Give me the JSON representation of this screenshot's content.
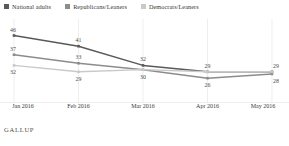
{
  "chart_data": {
    "type": "line",
    "title": "",
    "subtitle": "",
    "xlabel": "",
    "ylabel": "",
    "categories": [
      "Jan 2016",
      "Feb 2016",
      "Mar 2016",
      "Apr 2016",
      "May 2016"
    ],
    "xtick_labels": [
      "Jan 2016",
      "Feb 2016",
      "Mar 2016",
      "Apr 2016",
      "May 2016"
    ],
    "ylim": [
      20,
      50
    ],
    "grid": false,
    "legend_position": "top-left",
    "series": [
      {
        "name": "National adults",
        "color": "#595959",
        "values": [
          46,
          41,
          32,
          29,
          29
        ],
        "labels": [
          "46",
          "41",
          "32",
          "29",
          "29"
        ]
      },
      {
        "name": "Republicans/Leaners",
        "color": "#8c8c8c",
        "values": [
          37,
          33,
          30,
          26,
          28
        ],
        "labels": [
          "37",
          "33",
          "30",
          "26",
          "28"
        ]
      },
      {
        "name": "Democrats/Leaners",
        "color": "#c9c9c9",
        "values": [
          32,
          29,
          30,
          29,
          29
        ],
        "labels": [
          "32",
          "29",
          "",
          "",
          ""
        ]
      }
    ]
  },
  "legend": {
    "items": [
      {
        "label": "National adults",
        "color": "#595959"
      },
      {
        "label": "Republicans/Leaners",
        "color": "#8c8c8c"
      },
      {
        "label": "Democrats/Leaners",
        "color": "#c9c9c9"
      }
    ]
  },
  "footer": {
    "brand": "GALLUP"
  }
}
